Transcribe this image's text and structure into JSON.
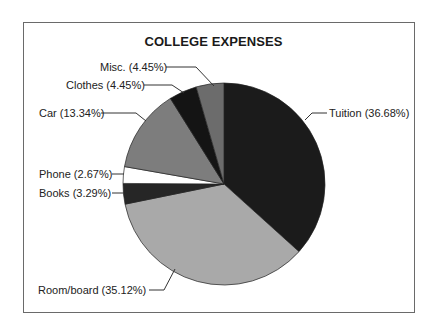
{
  "chart_data": {
    "type": "pie",
    "title": "COLLEGE EXPENSES",
    "start_angle_deg": 0,
    "direction": "clockwise",
    "slices": [
      {
        "name": "Tuition",
        "value": 36.68,
        "label": "Tuition (36.68%)",
        "color": "#1b1b1b"
      },
      {
        "name": "Room/board",
        "value": 35.12,
        "label": "Room/board (35.12%)",
        "color": "#a9a9a9"
      },
      {
        "name": "Books",
        "value": 3.29,
        "label": "Books (3.29%)",
        "color": "#262626"
      },
      {
        "name": "Phone",
        "value": 2.67,
        "label": "Phone (2.67%)",
        "color": "#ffffff"
      },
      {
        "name": "Car",
        "value": 13.34,
        "label": "Car (13.34%)",
        "color": "#7d7d7d"
      },
      {
        "name": "Clothes",
        "value": 4.45,
        "label": "Clothes (4.45%)",
        "color": "#141414"
      },
      {
        "name": "Misc.",
        "value": 4.45,
        "label": "Misc. (4.45%)",
        "color": "#6c6c6c"
      }
    ],
    "legend": "none (callout labels)"
  },
  "labels": {
    "title": "COLLEGE EXPENSES",
    "tuition": "Tuition (36.68%)",
    "room": "Room/board (35.12%)",
    "books": "Books (3.29%)",
    "phone": "Phone (2.67%)",
    "car": "Car (13.34%)",
    "clothes": "Clothes (4.45%)",
    "misc": "Misc. (4.45%)"
  }
}
